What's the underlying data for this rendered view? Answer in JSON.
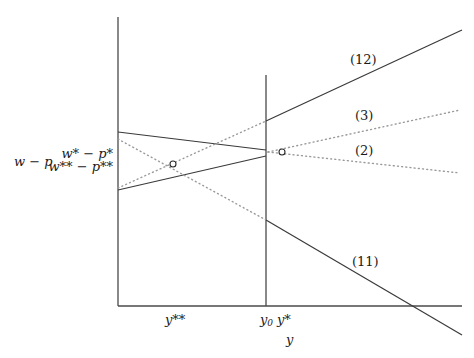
{
  "diagram": {
    "y_axis_label": "w − p",
    "x_axis_label": "y",
    "y_ticks": {
      "star": "w* − p*",
      "double_star": "w** − p**"
    },
    "x_ticks": {
      "double_star": "y**",
      "y0": "y",
      "y0_sub": "0",
      "star": "y*"
    },
    "line_labels": {
      "l12": "(12)",
      "l3": "(3)",
      "l2": "(2)",
      "l11": "(11)"
    }
  }
}
